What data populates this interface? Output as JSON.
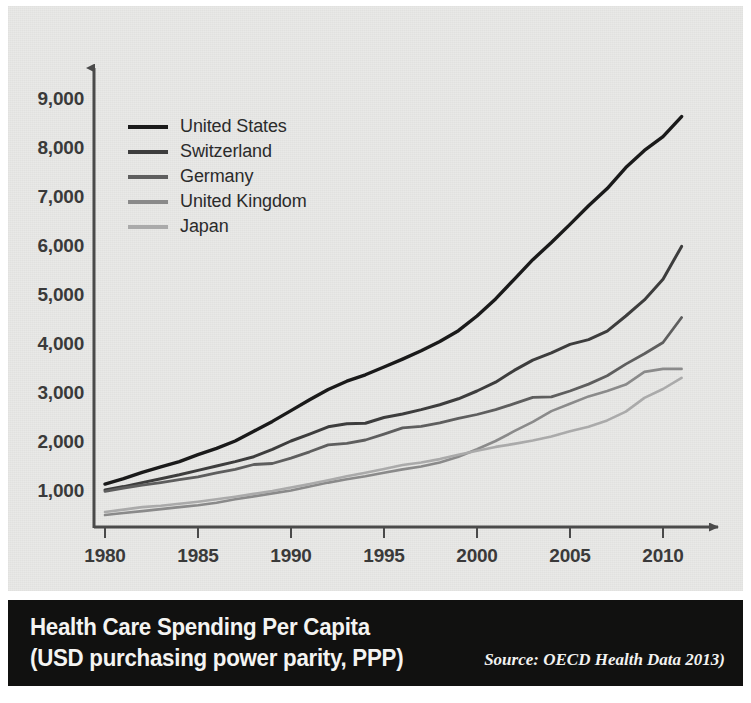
{
  "caption": {
    "line1": "Health Care Spending Per Capita",
    "line2": "(USD purchasing power parity, PPP)",
    "source": "Source: OECD Health Data 2013)"
  },
  "colors": {
    "background": "#e9e9e7",
    "caption_bar": "#111110",
    "axis": "#4a4a4a",
    "united_states": "#1a1a1a",
    "switzerland": "#3d3d3d",
    "germany": "#5e5e5e",
    "united_kingdom": "#8a8a8a",
    "japan": "#aaaaaa"
  },
  "chart_data": {
    "type": "line",
    "title": "Health Care Spending Per Capita",
    "subtitle": "(USD purchasing power parity, PPP)",
    "xlabel": "",
    "ylabel": "",
    "xlim": [
      1980,
      2012
    ],
    "ylim": [
      0,
      9400
    ],
    "grid": false,
    "legend_position": "upper-left",
    "x_ticks": [
      1980,
      1985,
      1990,
      1995,
      2000,
      2005,
      2010
    ],
    "y_ticks": [
      1000,
      2000,
      3000,
      4000,
      5000,
      6000,
      7000,
      8000,
      9000
    ],
    "y_tick_labels": [
      "1,000",
      "2,000",
      "3,000",
      "4,000",
      "5,000",
      "6,000",
      "7,000",
      "8,000",
      "9,000"
    ],
    "x_tick_labels": [
      "1980",
      "1985",
      "1990",
      "1995",
      "2000",
      "2005",
      "2010"
    ],
    "x": [
      1980,
      1981,
      1982,
      1983,
      1984,
      1985,
      1986,
      1987,
      1988,
      1989,
      1990,
      1991,
      1992,
      1993,
      1994,
      1995,
      1996,
      1997,
      1998,
      1999,
      2000,
      2001,
      2002,
      2003,
      2004,
      2005,
      2006,
      2007,
      2008,
      2009,
      2010,
      2011
    ],
    "series": [
      {
        "name": "United States",
        "color": "#1a1a1a",
        "values": [
          1100,
          1210,
          1340,
          1450,
          1560,
          1700,
          1830,
          1980,
          2180,
          2380,
          2600,
          2820,
          3030,
          3200,
          3330,
          3490,
          3650,
          3820,
          4010,
          4230,
          4530,
          4880,
          5280,
          5680,
          6030,
          6400,
          6780,
          7130,
          7560,
          7910,
          8190,
          8600
        ]
      },
      {
        "name": "Switzerland",
        "color": "#3d3d3d",
        "values": [
          980,
          1050,
          1130,
          1210,
          1290,
          1380,
          1470,
          1560,
          1660,
          1810,
          1980,
          2120,
          2270,
          2330,
          2340,
          2460,
          2530,
          2620,
          2720,
          2840,
          3000,
          3180,
          3420,
          3630,
          3780,
          3950,
          4050,
          4220,
          4530,
          4860,
          5280,
          5950
        ]
      },
      {
        "name": "Germany",
        "color": "#5e5e5e",
        "values": [
          950,
          1020,
          1080,
          1130,
          1190,
          1250,
          1330,
          1400,
          1500,
          1520,
          1630,
          1760,
          1900,
          1930,
          2000,
          2120,
          2250,
          2280,
          2350,
          2440,
          2520,
          2620,
          2740,
          2870,
          2880,
          3000,
          3140,
          3310,
          3550,
          3760,
          3990,
          4500
        ]
      },
      {
        "name": "United Kingdom",
        "color": "#8a8a8a",
        "values": [
          470,
          510,
          550,
          590,
          630,
          670,
          720,
          790,
          850,
          910,
          970,
          1050,
          1130,
          1200,
          1260,
          1330,
          1400,
          1460,
          1540,
          1660,
          1810,
          1980,
          2180,
          2370,
          2590,
          2740,
          2890,
          3000,
          3130,
          3390,
          3450,
          3450
        ]
      },
      {
        "name": "Japan",
        "color": "#aaaaaa",
        "values": [
          530,
          580,
          630,
          660,
          700,
          740,
          790,
          840,
          900,
          960,
          1030,
          1100,
          1180,
          1260,
          1330,
          1410,
          1490,
          1540,
          1610,
          1700,
          1780,
          1860,
          1920,
          1990,
          2070,
          2180,
          2270,
          2400,
          2580,
          2860,
          3040,
          3270
        ]
      }
    ]
  },
  "legend": {
    "entries": [
      {
        "label": "United States",
        "color": "#1a1a1a"
      },
      {
        "label": "Switzerland",
        "color": "#3d3d3d"
      },
      {
        "label": "Germany",
        "color": "#5e5e5e"
      },
      {
        "label": "United Kingdom",
        "color": "#8a8a8a"
      },
      {
        "label": "Japan",
        "color": "#aaaaaa"
      }
    ]
  }
}
